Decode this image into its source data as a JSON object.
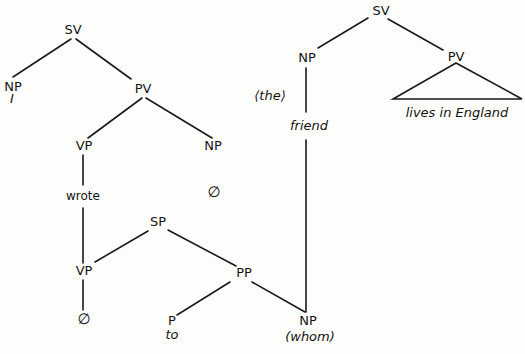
{
  "diagram": {
    "type": "syntax-tree",
    "trees": [
      {
        "name": "main-clause",
        "nodes": [
          {
            "id": "sv1",
            "label": "SV",
            "x": 73,
            "y": 34
          },
          {
            "id": "np1",
            "label": "NP",
            "x": 13,
            "y": 91,
            "word": "I",
            "wx": 12,
            "wy": 103
          },
          {
            "id": "pv1",
            "label": "PV",
            "x": 143,
            "y": 93
          },
          {
            "id": "vp1",
            "label": "VP",
            "x": 84,
            "y": 150
          },
          {
            "id": "np2",
            "label": "NP",
            "x": 213,
            "y": 150
          },
          {
            "id": "null1",
            "label": "∅",
            "x": 214,
            "y": 197
          },
          {
            "id": "wrote",
            "label": "wrote",
            "x": 83,
            "y": 200
          },
          {
            "id": "sp1",
            "label": "SP",
            "x": 158,
            "y": 226
          },
          {
            "id": "vp2",
            "label": "VP",
            "x": 84,
            "y": 275
          },
          {
            "id": "pp1",
            "label": "PP",
            "x": 244,
            "y": 277
          },
          {
            "id": "null2",
            "label": "∅",
            "x": 84,
            "y": 323
          },
          {
            "id": "p1",
            "label": "P",
            "x": 172,
            "y": 324,
            "word": "to",
            "wx": 172,
            "wy": 338
          },
          {
            "id": "np3",
            "label": "NP",
            "x": 308,
            "y": 324,
            "word": "(whom)",
            "wx": 310,
            "wy": 341
          }
        ]
      },
      {
        "name": "relative-clause",
        "nodes": [
          {
            "id": "sv2",
            "label": "SV",
            "x": 381,
            "y": 15
          },
          {
            "id": "np4",
            "label": "NP",
            "x": 307,
            "y": 62
          },
          {
            "id": "pv2",
            "label": "PV",
            "x": 456,
            "y": 62
          },
          {
            "id": "the",
            "label": "⟨the⟩",
            "x": 270,
            "y": 100
          },
          {
            "id": "friend",
            "label": "friend",
            "x": 309,
            "y": 129
          },
          {
            "id": "lives",
            "label": "lives in England",
            "x": 457,
            "y": 117
          }
        ]
      }
    ],
    "labels": {
      "sv1": "SV",
      "np1": "NP",
      "np1_word": "I",
      "pv1": "PV",
      "vp1": "VP",
      "np2": "NP",
      "null1": "∅",
      "wrote": "wrote",
      "sp1": "SP",
      "vp2": "VP",
      "pp1": "PP",
      "null2": "∅",
      "p1": "P",
      "p1_word": "to",
      "np3": "NP",
      "np3_word": "(whom)",
      "sv2": "SV",
      "np4": "NP",
      "pv2": "PV",
      "the": "⟨the⟩",
      "friend": "friend",
      "lives": "lives in England"
    }
  }
}
